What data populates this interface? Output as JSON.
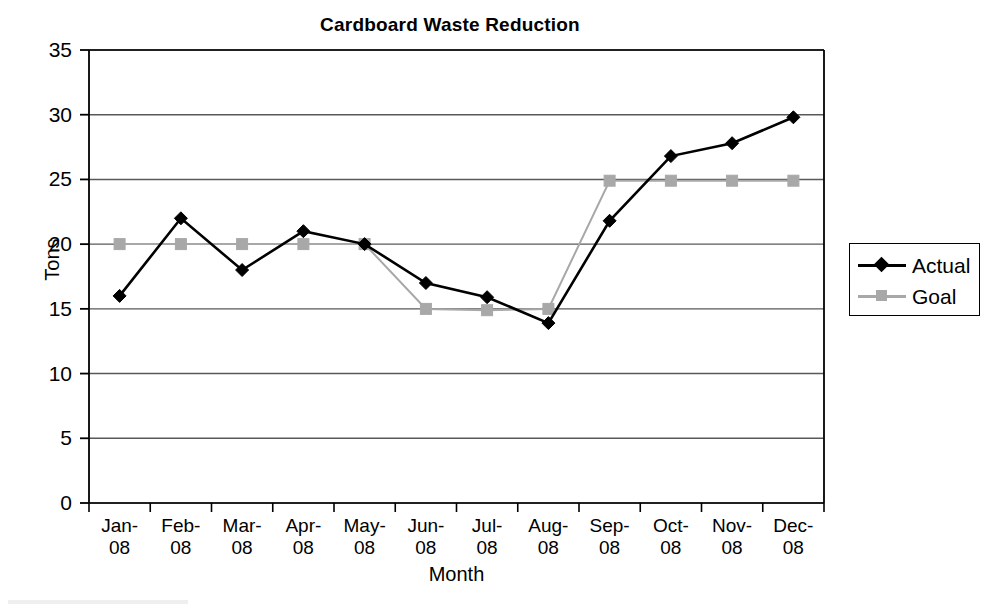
{
  "chart_data": {
    "type": "line",
    "title": "Cardboard Waste Reduction",
    "xlabel": "Month",
    "ylabel": "Tons",
    "ylim": [
      0,
      35
    ],
    "ytick_step": 5,
    "yticks": [
      "0",
      "5",
      "10",
      "15",
      "20",
      "25",
      "30",
      "35"
    ],
    "grid": true,
    "legend_position": "right",
    "categories": [
      "Jan-08",
      "Feb-08",
      "Mar-08",
      "Apr-08",
      "May-08",
      "Jun-08",
      "Jul-08",
      "Aug-08",
      "Sep-08",
      "Oct-08",
      "Nov-08",
      "Dec-08"
    ],
    "category_lines": [
      [
        "Jan-",
        "08"
      ],
      [
        "Feb-",
        "08"
      ],
      [
        "Mar-",
        "08"
      ],
      [
        "Apr-",
        "08"
      ],
      [
        "May-",
        "08"
      ],
      [
        "Jun-",
        "08"
      ],
      [
        "Jul-",
        "08"
      ],
      [
        "Aug-",
        "08"
      ],
      [
        "Sep-",
        "08"
      ],
      [
        "Oct-",
        "08"
      ],
      [
        "Nov-",
        "08"
      ],
      [
        "Dec-",
        "08"
      ]
    ],
    "series": [
      {
        "name": "Actual",
        "color": "#000000",
        "marker": "diamond",
        "values": [
          16.0,
          22.0,
          18.0,
          21.0,
          20.0,
          17.0,
          15.9,
          13.9,
          21.8,
          26.8,
          27.8,
          29.8
        ]
      },
      {
        "name": "Goal",
        "color": "#a8a8a8",
        "marker": "square",
        "values": [
          20.0,
          20.0,
          20.0,
          20.0,
          20.0,
          15.0,
          14.9,
          15.0,
          24.9,
          24.9,
          24.9,
          24.9
        ]
      }
    ]
  },
  "legend": {
    "entries": [
      {
        "label": "Actual"
      },
      {
        "label": "Goal"
      }
    ]
  },
  "colors": {
    "actual": "#000000",
    "goal": "#a8a8a8",
    "grid": "#595959",
    "axis": "#000000",
    "background": "#ffffff"
  }
}
